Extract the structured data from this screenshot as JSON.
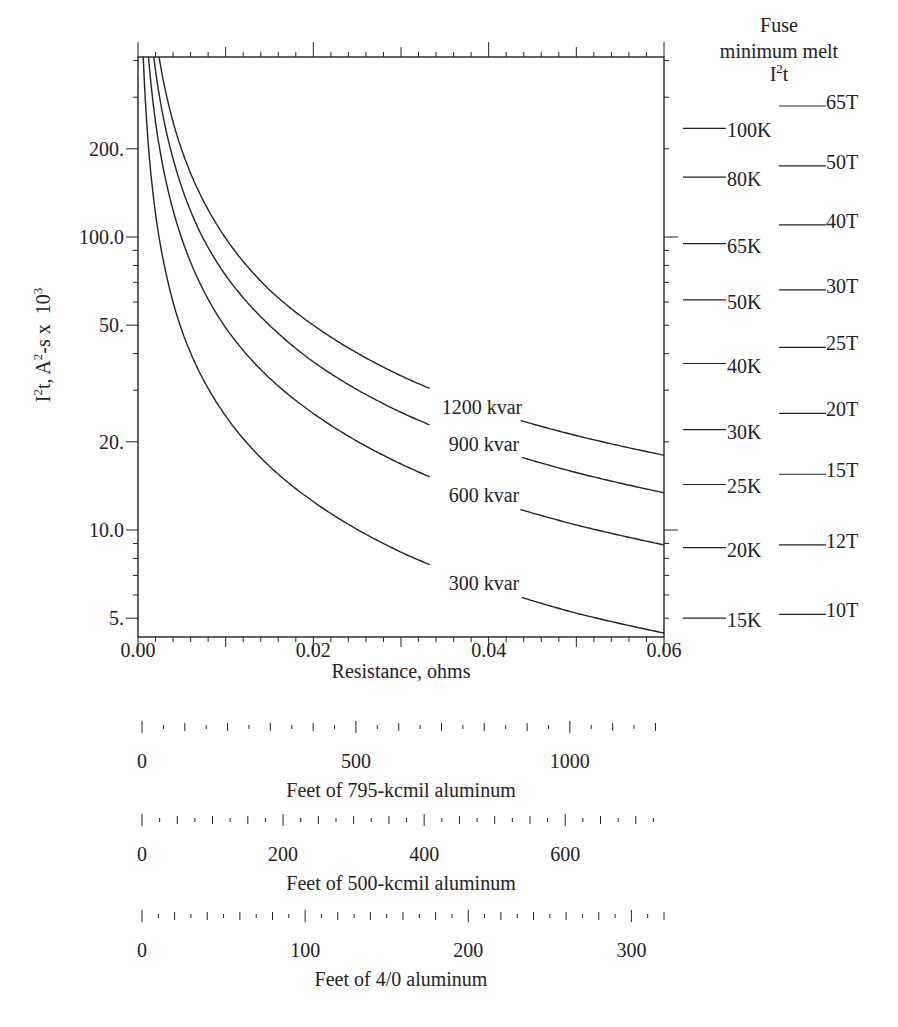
{
  "chart_data": {
    "type": "line",
    "title": "",
    "xlabel": "Resistance, ohms",
    "ylabel": "I2t, A2-s x 10^3",
    "ylabel_parts": {
      "base": "I",
      "sup1": "2",
      "mid": "t, A",
      "sup2": "2",
      "tail": "-s x  10",
      "sup3": "3"
    },
    "yscale": "log",
    "xlim": [
      0.0,
      0.06
    ],
    "ylim": [
      4.3,
      411
    ],
    "grid": false,
    "x_ticks": [
      "0.00",
      "0.02",
      "0.04",
      "0.06"
    ],
    "x_tick_values": [
      0.0,
      0.02,
      0.04,
      0.06
    ],
    "y_ticks": [
      "200.",
      "100.0",
      "50.",
      "20.",
      "10.0",
      "5."
    ],
    "y_tick_values": [
      200,
      100,
      50,
      20,
      10,
      5
    ],
    "series": [
      {
        "name": "300 kvar",
        "label": "300 kvar",
        "x": [
          0.0006,
          0.002,
          0.005,
          0.01,
          0.015,
          0.02,
          0.03,
          0.04,
          0.05,
          0.06
        ],
        "y": [
          411,
          120,
          48,
          24.5,
          16.5,
          12.5,
          8.4,
          6.4,
          5.2,
          4.45
        ]
      },
      {
        "name": "600 kvar",
        "label": "600 kvar",
        "x": [
          0.0012,
          0.003,
          0.006,
          0.01,
          0.015,
          0.02,
          0.03,
          0.04,
          0.05,
          0.06
        ],
        "y": [
          411,
          165,
          82,
          49,
          33,
          25,
          16.8,
          12.7,
          10.4,
          8.9
        ]
      },
      {
        "name": "900 kvar",
        "label": "900 kvar",
        "x": [
          0.0018,
          0.004,
          0.007,
          0.01,
          0.015,
          0.02,
          0.03,
          0.04,
          0.05,
          0.06
        ],
        "y": [
          411,
          185,
          105,
          74,
          50,
          37.5,
          25.2,
          19.2,
          15.7,
          13.4
        ]
      },
      {
        "name": "1200 kvar",
        "label": "1200 kvar",
        "x": [
          0.0024,
          0.005,
          0.008,
          0.01,
          0.015,
          0.02,
          0.03,
          0.04,
          0.05,
          0.06
        ],
        "y": [
          411,
          198,
          124,
          99,
          66,
          50,
          33.6,
          25.5,
          21,
          18
        ]
      }
    ],
    "right_axis": {
      "title_lines": [
        "Fuse",
        "minimum melt"
      ],
      "title_sym": {
        "base": "I",
        "sup": "2",
        "tail": "t"
      },
      "k_fuses": [
        {
          "label": "100K",
          "value": 235
        },
        {
          "label": "80K",
          "value": 160
        },
        {
          "label": "65K",
          "value": 95
        },
        {
          "label": "50K",
          "value": 61
        },
        {
          "label": "40K",
          "value": 37
        },
        {
          "label": "30K",
          "value": 22
        },
        {
          "label": "25K",
          "value": 14.3
        },
        {
          "label": "20K",
          "value": 8.7
        },
        {
          "label": "15K",
          "value": 5.0
        }
      ],
      "t_fuses": [
        {
          "label": "65T",
          "value": 280
        },
        {
          "label": "50T",
          "value": 175
        },
        {
          "label": "40T",
          "value": 110
        },
        {
          "label": "30T",
          "value": 66
        },
        {
          "label": "25T",
          "value": 42
        },
        {
          "label": "20T",
          "value": 25
        },
        {
          "label": "15T",
          "value": 15.5
        },
        {
          "label": "12T",
          "value": 8.9
        },
        {
          "label": "10T",
          "value": 5.15
        }
      ]
    },
    "secondary_x_scales": [
      {
        "label": "Feet of 795-kcmil aluminum",
        "ticks": [
          "0",
          "500",
          "1000"
        ],
        "tick_values": [
          0,
          500,
          1000
        ],
        "max_at_right": 1220,
        "minor_step": 50
      },
      {
        "label": "Feet of 500-kcmil aluminum",
        "ticks": [
          "0",
          "200",
          "400",
          "600"
        ],
        "tick_values": [
          0,
          200,
          400,
          600
        ],
        "max_at_right": 740,
        "minor_step": 25
      },
      {
        "label": "Feet of 4/0 aluminum",
        "ticks": [
          "0",
          "100",
          "200",
          "300"
        ],
        "tick_values": [
          0,
          100,
          200,
          300
        ],
        "max_at_right": 320,
        "minor_step": 10
      }
    ]
  },
  "colors": {
    "ink": "#222222",
    "background": "#ffffff"
  }
}
